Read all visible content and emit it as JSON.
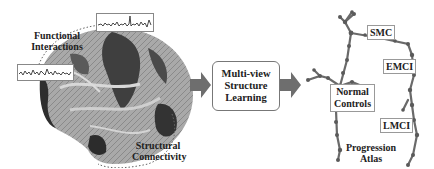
{
  "left_panel": {
    "functional_label_line1": "Functional",
    "functional_label_line2": "Interactions",
    "structural_label_line1": "Structural",
    "structural_label_line2": "Connectivity"
  },
  "center": {
    "line1": "Multi-view",
    "line2": "Structure",
    "line3": "Learning"
  },
  "right_panel": {
    "stages": {
      "smc": "SMC",
      "emci": "EMCI",
      "normal_controls_line1": "Normal",
      "normal_controls_line2": "Controls",
      "lmci": "LMCI"
    },
    "atlas_label_line1": "Progression",
    "atlas_label_line2": "Atlas"
  },
  "colors": {
    "arrow": "#6e6e6e",
    "tree": "#6a6a6a",
    "brain_dark": "#3a3a3a",
    "brain_light": "#bdbdbd"
  }
}
